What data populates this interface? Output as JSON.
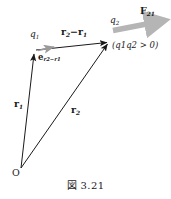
{
  "figure": {
    "caption": "図 3.21",
    "background_color": "#ffffff",
    "line_color": "#1a1a1a",
    "force_arrow_color": "#b5b5b5",
    "unit_vector_color": "#9a9a9a"
  },
  "labels": {
    "origin": "O",
    "charge_1": "q",
    "charge_1_sub": "1",
    "charge_2": "q",
    "charge_2_sub": "2",
    "position_vector_1": "r",
    "position_vector_1_sub": "1",
    "position_vector_2": "r",
    "position_vector_2_sub": "2",
    "separation_vector": "r",
    "separation_vector_sub_a": "2",
    "separation_vector_minus": "−",
    "separation_vector_b": "r",
    "separation_vector_sub_b": "1",
    "unit_vector": "e",
    "unit_vector_sub": "r2−r1",
    "force": "F",
    "force_sub": "21",
    "charge_condition": "(q1q2 > 0)"
  },
  "geometry": {
    "origin_point": [
      21,
      168
    ],
    "charge_1_point": [
      34,
      52
    ],
    "charge_2_point": [
      109,
      42
    ],
    "force_arrow_start": [
      113,
      31
    ],
    "force_arrow_end": [
      165,
      21
    ],
    "unit_vector_start": [
      38,
      50
    ],
    "unit_vector_end": [
      56,
      46
    ]
  }
}
